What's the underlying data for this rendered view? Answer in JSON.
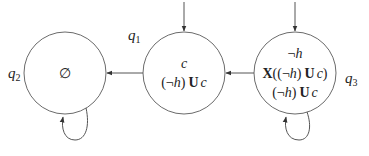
{
  "diagram": {
    "type": "automaton",
    "states": [
      {
        "id": "q2",
        "label_base": "q",
        "label_sub": "2",
        "formulas": [
          "∅"
        ],
        "initial": false,
        "self_loop": true
      },
      {
        "id": "q1",
        "label_base": "q",
        "label_sub": "1",
        "formulas": [
          "c",
          "(¬h) U c"
        ],
        "initial": true,
        "self_loop": false
      },
      {
        "id": "q3",
        "label_base": "q",
        "label_sub": "3",
        "formulas": [
          "¬h",
          "X((¬h) U c)",
          "(¬h) U c"
        ],
        "initial": true,
        "self_loop": true
      }
    ],
    "transitions": [
      {
        "from": "q1",
        "to": "q2"
      },
      {
        "from": "q3",
        "to": "q1"
      },
      {
        "from": "q2",
        "to": "q2"
      },
      {
        "from": "q3",
        "to": "q3"
      }
    ],
    "text": {
      "q2_empty": "∅",
      "q1_line1": "c",
      "q1_line2_open": "(¬",
      "q1_line2_h": "h",
      "q1_line2_close": ")",
      "q1_line2_U": "U",
      "q1_line2_c": "c",
      "q3_line1_neg": "¬",
      "q3_line1_h": "h",
      "q3_line2_X": "X",
      "q3_line2_open": "((¬",
      "q3_line2_h": "h",
      "q3_line2_close": ")",
      "q3_line2_U": "U",
      "q3_line2_c": "c",
      "q3_line2_end": ")",
      "q3_line3_open": "(¬",
      "q3_line3_h": "h",
      "q3_line3_close": ")",
      "q3_line3_U": "U",
      "q3_line3_c": "c"
    }
  }
}
